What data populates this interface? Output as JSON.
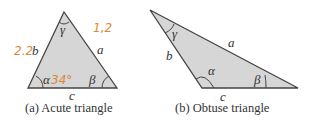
{
  "colors": {
    "fill": "#d6d6d6",
    "stroke": "#444444",
    "text": "#333333",
    "handwriting": "#d98a3a"
  },
  "figures": [
    {
      "id": "a",
      "caption": "(a)  Acute triangle",
      "labels": {
        "side_a": "a",
        "side_b": "b",
        "side_c": "c",
        "angle_alpha": "α",
        "angle_beta": "β",
        "angle_gamma": "γ"
      },
      "annotations": {
        "near_b": "2.2",
        "near_a": "1,2",
        "near_alpha": "34°"
      }
    },
    {
      "id": "b",
      "caption": "(b)  Obtuse triangle",
      "labels": {
        "side_a": "a",
        "side_b": "b",
        "side_c": "c",
        "angle_alpha": "α",
        "angle_beta": "β",
        "angle_gamma": "γ"
      }
    }
  ]
}
